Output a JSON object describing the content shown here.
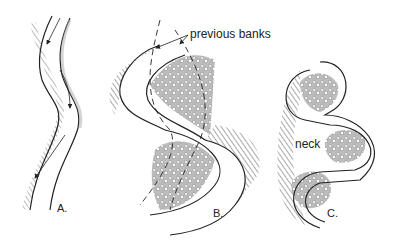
{
  "figure": {
    "panels": [
      {
        "id": "A",
        "label": "A."
      },
      {
        "id": "B",
        "label": "B."
      },
      {
        "id": "C",
        "label": "C."
      }
    ],
    "annotations": {
      "previous_banks": "previous banks",
      "neck": "neck"
    },
    "colors": {
      "line": "#222222",
      "hatch": "#555555",
      "stipple": "#9a9a9a",
      "background": "#ffffff"
    }
  }
}
